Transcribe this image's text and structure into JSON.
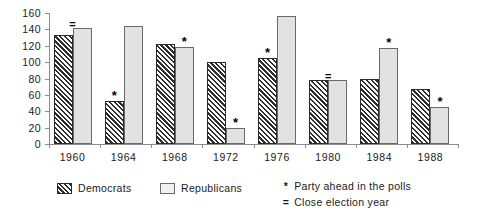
{
  "chart_data": {
    "type": "bar",
    "title": "",
    "xlabel": "",
    "ylabel": "",
    "ylim": [
      0,
      160
    ],
    "yticks": [
      0,
      20,
      40,
      60,
      80,
      100,
      120,
      140,
      160
    ],
    "grid": false,
    "legend_position": "bottom-left",
    "categories": [
      "1960",
      "1964",
      "1968",
      "1972",
      "1976",
      "1980",
      "1984",
      "1988"
    ],
    "series": [
      {
        "name": "Democrats",
        "values": [
          133,
          52,
          122,
          100,
          105,
          78,
          79,
          67
        ]
      },
      {
        "name": "Republicans",
        "values": [
          142,
          144,
          118,
          20,
          156,
          78,
          117,
          45
        ]
      }
    ],
    "annotations": [
      {
        "category": "1960",
        "symbol": "=",
        "meaning": "Close election year",
        "target": "between"
      },
      {
        "category": "1964",
        "symbol": "*",
        "meaning": "Party ahead in the polls",
        "target": "Democrats"
      },
      {
        "category": "1968",
        "symbol": "*",
        "meaning": "Party ahead in the polls",
        "target": "Republicans"
      },
      {
        "category": "1972",
        "symbol": "*",
        "meaning": "Party ahead in the polls",
        "target": "Republicans"
      },
      {
        "category": "1976",
        "symbol": "*",
        "meaning": "Party ahead in the polls",
        "target": "Democrats"
      },
      {
        "category": "1980",
        "symbol": "=",
        "meaning": "Close election year",
        "target": "between"
      },
      {
        "category": "1984",
        "symbol": "*",
        "meaning": "Party ahead in the polls",
        "target": "Republicans"
      },
      {
        "category": "1988",
        "symbol": "*",
        "meaning": "Party ahead in the polls",
        "target": "Republicans"
      }
    ]
  },
  "legend": {
    "items": [
      {
        "label": "Democrats",
        "swatch": "hatched-dark"
      },
      {
        "label": "Republicans",
        "swatch": "light-gray"
      }
    ],
    "notes": [
      {
        "glyph": "*",
        "text": "Party ahead in the polls"
      },
      {
        "glyph": "=",
        "text": "Close election year"
      }
    ]
  },
  "colors": {
    "democrat_hatch": "#2e2e2e",
    "republican_fill": "#e2e2e2",
    "axis": "#8d8d8d",
    "text": "#1a1a1a",
    "background": "#ffffff"
  }
}
